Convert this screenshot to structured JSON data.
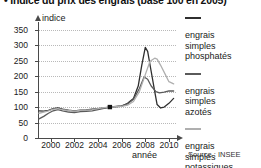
{
  "title": "Indice du prix des engrais (base 100 en 2005)",
  "title_bullet": "•",
  "source": "Source : INSEE",
  "axis": {
    "y_title": "indice",
    "x_title": "année"
  },
  "legend": [
    {
      "color": "#2f2f2f",
      "lines": [
        "engrais",
        "simples",
        "phosphatés"
      ],
      "name": "engrais simples phosphatés"
    },
    {
      "color": "#5a5a5a",
      "lines": [
        "engrais",
        "simples",
        "azotés"
      ],
      "name": "engrais simples azotés"
    },
    {
      "color": "#afafaf",
      "lines": [
        "engrais",
        "simples",
        "potassiques"
      ],
      "name": "engrais simples potassiques"
    }
  ],
  "chart_data": {
    "type": "line",
    "title": "Indice du prix des engrais (base 100 en 2005)",
    "xlabel": "année",
    "ylabel": "indice",
    "xlim": [
      1999,
      2010.6
    ],
    "ylim": [
      0,
      375
    ],
    "yticks": [
      0,
      50,
      100,
      150,
      200,
      250,
      300,
      350
    ],
    "xticks": [
      2000,
      2002,
      2004,
      2006,
      2008,
      2010
    ],
    "grid": "horizontal-dotted",
    "legend_position": "right",
    "base_marker": {
      "x": 2005,
      "y": 100,
      "label": "base 100 en 2005"
    },
    "series": [
      {
        "name": "engrais simples phosphatés",
        "color": "#2f2f2f",
        "x": [
          1999.0,
          1999.4,
          1999.8,
          2000.2,
          2000.6,
          2001.0,
          2001.5,
          2002.0,
          2002.5,
          2003.0,
          2003.5,
          2004.0,
          2004.5,
          2005.0,
          2005.5,
          2006.0,
          2006.5,
          2007.0,
          2007.4,
          2007.7,
          2008.0,
          2008.2,
          2008.5,
          2008.8,
          2009.0,
          2009.3,
          2009.6,
          2010.0,
          2010.4
        ],
        "y": [
          88,
          87,
          89,
          95,
          97,
          93,
          90,
          88,
          90,
          91,
          93,
          95,
          97,
          100,
          101,
          103,
          112,
          128,
          168,
          235,
          293,
          280,
          215,
          150,
          108,
          97,
          100,
          112,
          128
        ]
      },
      {
        "name": "engrais simples azotés",
        "color": "#5a5a5a",
        "x": [
          1999.0,
          1999.4,
          1999.8,
          2000.2,
          2000.6,
          2001.0,
          2001.5,
          2002.0,
          2002.5,
          2003.0,
          2003.5,
          2004.0,
          2004.5,
          2005.0,
          2005.5,
          2006.0,
          2006.5,
          2007.0,
          2007.5,
          2007.9,
          2008.2,
          2008.5,
          2008.9,
          2009.2,
          2009.6,
          2010.0,
          2010.4
        ],
        "y": [
          62,
          70,
          80,
          88,
          92,
          88,
          84,
          82,
          85,
          86,
          88,
          92,
          96,
          100,
          102,
          104,
          110,
          125,
          160,
          197,
          190,
          168,
          150,
          146,
          148,
          152,
          152
        ]
      },
      {
        "name": "engrais simples potassiques",
        "color": "#afafaf",
        "x": [
          1999.0,
          1999.4,
          1999.8,
          2000.2,
          2000.6,
          2001.0,
          2001.5,
          2002.0,
          2002.5,
          2003.0,
          2003.5,
          2004.0,
          2004.5,
          2005.0,
          2005.5,
          2006.0,
          2006.5,
          2007.0,
          2007.5,
          2008.0,
          2008.4,
          2008.8,
          2009.0,
          2009.3,
          2009.7,
          2010.0,
          2010.4
        ],
        "y": [
          80,
          84,
          88,
          93,
          95,
          92,
          89,
          87,
          89,
          90,
          92,
          95,
          98,
          100,
          101,
          102,
          106,
          118,
          150,
          205,
          248,
          258,
          255,
          235,
          205,
          182,
          175
        ]
      }
    ]
  }
}
